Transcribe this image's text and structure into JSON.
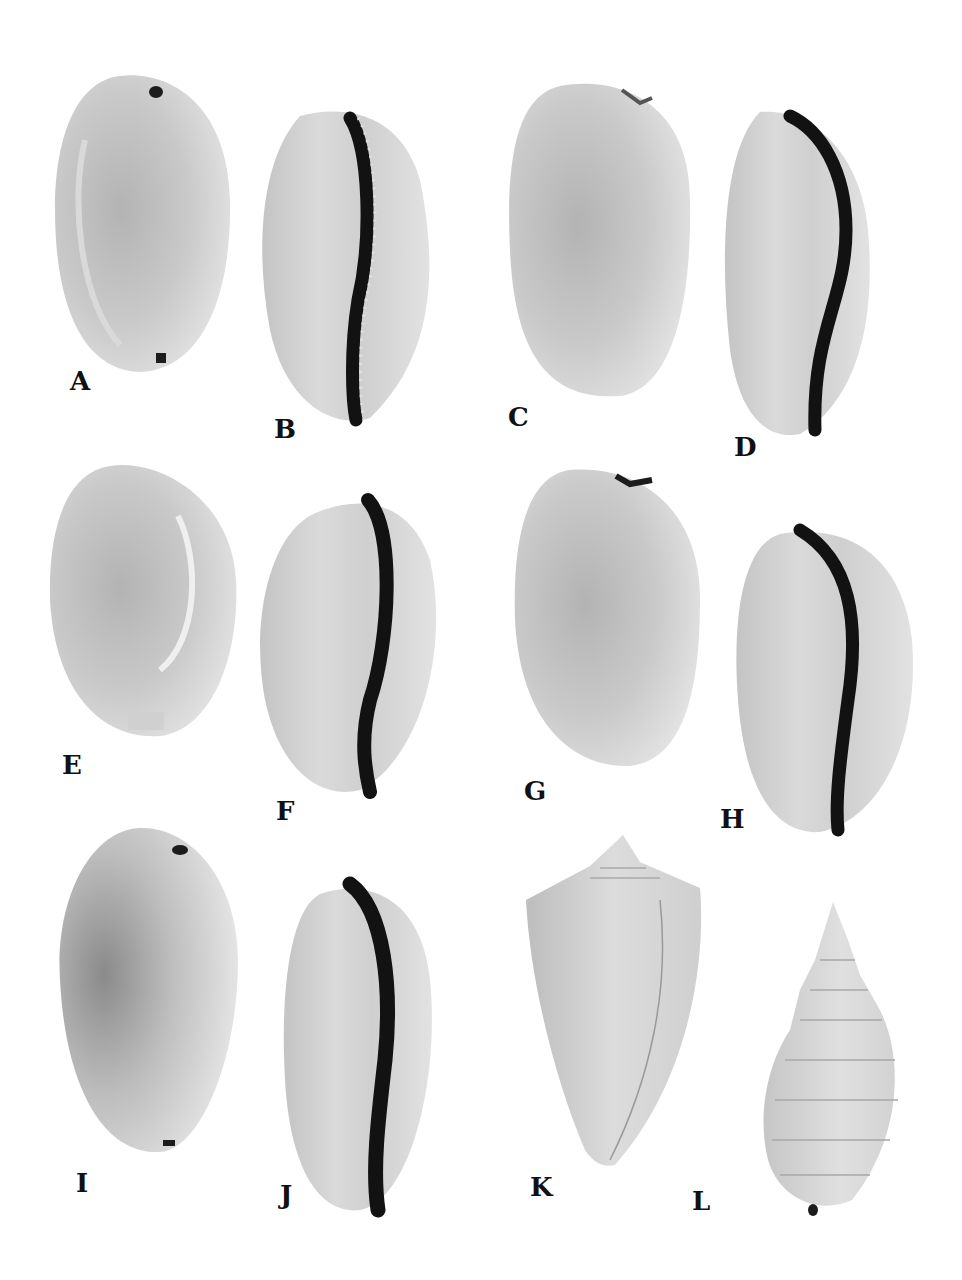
{
  "figure": {
    "type": "specimen-plate",
    "colors": {
      "background": "#ffffff",
      "shell_light": "#e4e4e4",
      "shell_mid": "#bdbdbd",
      "shell_dark": "#8f8f8f",
      "aperture": "#141414",
      "label": "#111111"
    },
    "specimens": [
      {
        "label": "A",
        "kind": "cowrie",
        "view": "dorsal"
      },
      {
        "label": "B",
        "kind": "cowrie",
        "view": "ventral"
      },
      {
        "label": "C",
        "kind": "cowrie",
        "view": "dorsal"
      },
      {
        "label": "D",
        "kind": "cowrie",
        "view": "ventral"
      },
      {
        "label": "E",
        "kind": "cowrie",
        "view": "dorsal"
      },
      {
        "label": "F",
        "kind": "cowrie",
        "view": "ventral"
      },
      {
        "label": "G",
        "kind": "cowrie",
        "view": "dorsal"
      },
      {
        "label": "H",
        "kind": "cowrie",
        "view": "ventral"
      },
      {
        "label": "I",
        "kind": "cowrie",
        "view": "dorsal"
      },
      {
        "label": "J",
        "kind": "cowrie",
        "view": "ventral"
      },
      {
        "label": "K",
        "kind": "cone shell",
        "view": "dorsal"
      },
      {
        "label": "L",
        "kind": "whelk",
        "view": "dorsal"
      }
    ]
  }
}
